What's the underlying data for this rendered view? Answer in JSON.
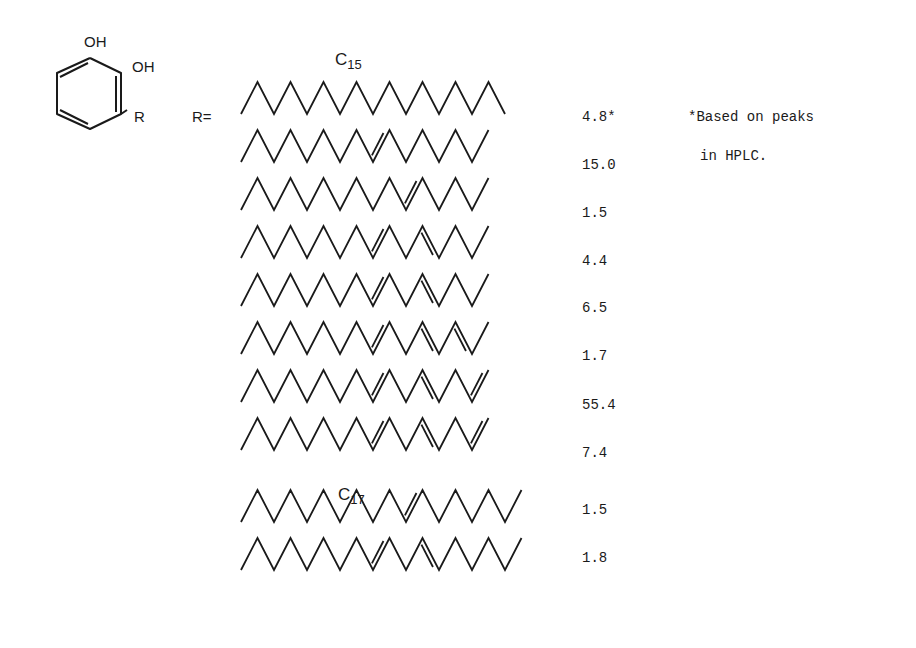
{
  "structure": {
    "ring_labels": {
      "oh1": "OH",
      "oh2": "OH",
      "r": "R"
    },
    "r_equals": "R="
  },
  "groups": {
    "c15": {
      "label": "C",
      "sub": "15"
    },
    "c17": {
      "label": "C",
      "sub": "17"
    }
  },
  "footnote": {
    "line1": "*Based on peaks",
    "line2": "in HPLC."
  },
  "chains": [
    {
      "group": "C15",
      "value": "4.8*",
      "segments": 16,
      "double_bonds": []
    },
    {
      "group": "C15",
      "value": "15.0",
      "segments": 15,
      "double_bonds": [
        8
      ]
    },
    {
      "group": "C15",
      "value": "1.5",
      "segments": 15,
      "double_bonds": [
        10
      ]
    },
    {
      "group": "C15",
      "value": "4.4",
      "segments": 15,
      "double_bonds": [
        8,
        11
      ]
    },
    {
      "group": "C15",
      "value": "6.5",
      "segments": 15,
      "double_bonds": [
        8,
        11
      ]
    },
    {
      "group": "C15",
      "value": "1.7",
      "segments": 15,
      "double_bonds": [
        8,
        11,
        13
      ]
    },
    {
      "group": "C15",
      "value": "55.4",
      "segments": 15,
      "double_bonds": [
        8,
        11,
        14
      ]
    },
    {
      "group": "C15",
      "value": "7.4",
      "segments": 15,
      "double_bonds": [
        8,
        11,
        14
      ]
    },
    {
      "group": "C17",
      "value": "1.5",
      "segments": 17,
      "double_bonds": [
        10
      ]
    },
    {
      "group": "C17",
      "value": "1.8",
      "segments": 17,
      "double_bonds": [
        8,
        11
      ]
    }
  ]
}
